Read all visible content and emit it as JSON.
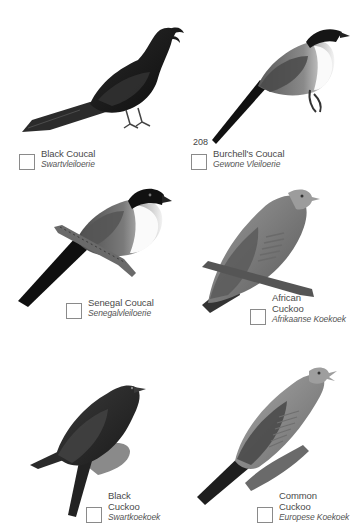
{
  "page": {
    "page_number": "208",
    "background": "#ffffff"
  },
  "species": [
    {
      "english": "Black Coucal",
      "english_lines": [
        "Black Coucal"
      ],
      "afrikaans": "Swartvleiloerie",
      "checked": false,
      "icon": "black-coucal-illustration"
    },
    {
      "english": "Burchell's Coucal",
      "english_lines": [
        "Burchell's Coucal"
      ],
      "afrikaans": "Gewone Vleiloerie",
      "checked": false,
      "icon": "burchells-coucal-illustration"
    },
    {
      "english": "Senegal Coucal",
      "english_lines": [
        "Senegal Coucal"
      ],
      "afrikaans": "Senegalvleiloerie",
      "checked": false,
      "icon": "senegal-coucal-illustration"
    },
    {
      "english": "African Cuckoo",
      "english_lines": [
        "African",
        "Cuckoo"
      ],
      "afrikaans": "Afrikaanse Koekoek",
      "checked": false,
      "icon": "african-cuckoo-illustration"
    },
    {
      "english": "Black Cuckoo",
      "english_lines": [
        "Black",
        "Cuckoo"
      ],
      "afrikaans": "Swartkoekoek",
      "checked": false,
      "icon": "black-cuckoo-illustration"
    },
    {
      "english": "Common Cuckoo",
      "english_lines": [
        "Common",
        "Cuckoo"
      ],
      "afrikaans": "Europese Koekoek",
      "checked": false,
      "icon": "common-cuckoo-illustration"
    }
  ]
}
